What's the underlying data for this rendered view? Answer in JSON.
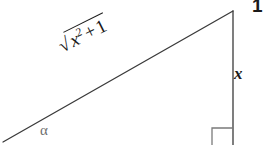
{
  "figure": {
    "background_color": "#ffffff",
    "stroke_color": "#3a3a3a",
    "text_color": "#1a1a1a",
    "alpha_color": "#6e6e6e",
    "stroke_width": 1.3
  },
  "geometry": {
    "vertices": {
      "left": [
        3,
        142
      ],
      "apex": [
        233,
        11
      ],
      "bottom_right": [
        233,
        145
      ]
    },
    "hypotenuse": {
      "from": [
        3,
        142
      ],
      "to": [
        233,
        11
      ]
    },
    "vertical_leg": {
      "from": [
        233,
        11
      ],
      "to": [
        233,
        145
      ]
    },
    "right_angle_marker": {
      "corner": [
        233,
        145
      ],
      "size": 21,
      "top_edge": {
        "from": [
          212,
          128
        ],
        "to": [
          233,
          128
        ]
      },
      "left_edge": {
        "from": [
          212,
          128
        ],
        "to": [
          212,
          145
        ]
      }
    }
  },
  "labels": {
    "angle": {
      "symbol": "α",
      "name": "alpha",
      "position": [
        44,
        132
      ]
    },
    "vertical_side": {
      "text": "x",
      "position": [
        240,
        75
      ]
    },
    "top_clipped": {
      "text": "1",
      "position": [
        256,
        8
      ],
      "note": "clipped at right edge of image"
    },
    "hypotenuse": {
      "expression": "√(x² + 1)",
      "radical_symbol": "√",
      "radicand_base": "x",
      "radicand_exponent": "2",
      "operator": "+",
      "addend": "1",
      "rotation_degrees": -26.5,
      "position": [
        62,
        35
      ]
    }
  }
}
